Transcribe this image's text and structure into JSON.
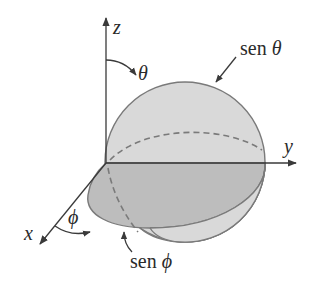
{
  "figure": {
    "type": "3d-radiation-pattern-diagram",
    "axes": {
      "x": {
        "label": "x"
      },
      "y": {
        "label": "y"
      },
      "z": {
        "label": "z"
      }
    },
    "angles": {
      "theta": {
        "symbol": "θ"
      },
      "phi": {
        "symbol": "ϕ"
      }
    },
    "annotations": {
      "sen_theta": {
        "prefix": "sen ",
        "symbol": "θ"
      },
      "sen_phi": {
        "prefix": "sen ",
        "symbol": "ϕ"
      }
    },
    "colors": {
      "axis": "#3a3a3a",
      "sphere_fill": "#d9d9d9",
      "sphere_stroke": "#7a7a7a",
      "disc_fill": "#bdbdbd",
      "disc_stroke": "#7a7a7a",
      "dashed": "#7a7a7a",
      "text": "#2a2a2a"
    }
  }
}
